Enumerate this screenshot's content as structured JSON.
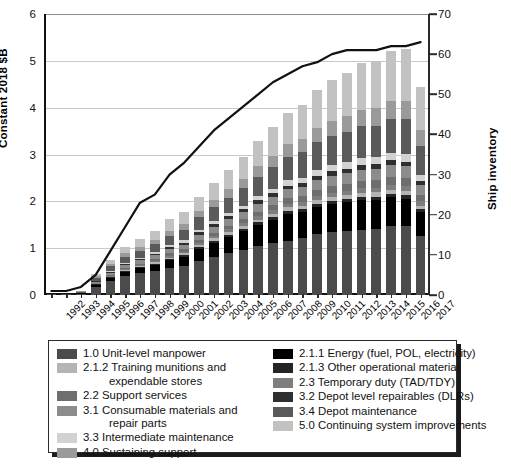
{
  "axes": {
    "left_title": "Constant 2018 $B",
    "right_title": "Ship inventory",
    "left_ticks": [
      "0",
      "1",
      "2",
      "3",
      "4",
      "5",
      "6"
    ],
    "right_ticks": [
      "0",
      "10",
      "20",
      "30",
      "40",
      "50",
      "60",
      "70"
    ]
  },
  "legend": {
    "left_column": [
      {
        "key": "manpower",
        "label": "1.0 Unit-level manpower",
        "cont": "",
        "color": "#4b4b4b"
      },
      {
        "key": "training",
        "label": "2.1.2 Training munitions and",
        "cont": "expendable stores",
        "color": "#b4b4b4"
      },
      {
        "key": "support",
        "label": "2.2 Support services",
        "cont": "",
        "color": "#6e6e6e"
      },
      {
        "key": "consumable",
        "label": "3.1 Consumable materials and",
        "cont": "repair parts",
        "color": "#8c8c8c"
      },
      {
        "key": "intermed",
        "label": "3.3 Intermediate maintenance",
        "cont": "",
        "color": "#d2d2d2"
      },
      {
        "key": "sustaining",
        "label": "4.0 Sustaining support",
        "cont": "",
        "color": "#9a9a9a"
      }
    ],
    "right_column": [
      {
        "key": "energy",
        "label": "2.1.1 Energy (fuel, POL, electricity)",
        "color": "#000000"
      },
      {
        "key": "othermat",
        "label": "2.1.3 Other operational material",
        "color": "#242424"
      },
      {
        "key": "tad",
        "label": "2.3 Temporary duty (TAD/TDY)",
        "color": "#7e7e7e"
      },
      {
        "key": "dlr",
        "label": "3.2 Depot level repairables (DLRs)",
        "color": "#2f2f2f"
      },
      {
        "key": "depotmnt",
        "label": "3.4 Depot maintenance",
        "color": "#5a5a5a"
      },
      {
        "key": "continue",
        "label": "5.0 Continuing system improvements",
        "color": "#c2c2c2"
      }
    ]
  },
  "chart_data": {
    "type": "bar",
    "title": "",
    "xlabel": "",
    "ylabel": "Constant 2018 $B",
    "y2label": "Ship inventory",
    "ylim": [
      0,
      6
    ],
    "y2lim": [
      0,
      70
    ],
    "grid": true,
    "legend_position": "bottom",
    "categories": [
      "1992",
      "1993",
      "1994",
      "1995",
      "1996",
      "1997",
      "1998",
      "1999",
      "2000",
      "2001",
      "2002",
      "2003",
      "2004",
      "2005",
      "2006",
      "2007",
      "2008",
      "2009",
      "2010",
      "2011",
      "2012",
      "2013",
      "2014",
      "2015",
      "2016",
      "2017"
    ],
    "stack_order": [
      "manpower",
      "energy",
      "othermat",
      "training",
      "tad",
      "support",
      "consumable",
      "dlr",
      "intermed",
      "depotmnt",
      "sustaining",
      "continue"
    ],
    "series": [
      {
        "name": "1.0 Unit-level manpower",
        "key": "manpower",
        "color": "#4b4b4b",
        "values": [
          0.02,
          0.02,
          0.03,
          0.18,
          0.3,
          0.4,
          0.46,
          0.52,
          0.57,
          0.61,
          0.72,
          0.82,
          0.9,
          0.97,
          1.04,
          1.1,
          1.16,
          1.22,
          1.3,
          1.34,
          1.36,
          1.39,
          1.41,
          1.47,
          1.48,
          1.27
        ]
      },
      {
        "name": "2.1.1 Energy (fuel, POL, electricity)",
        "key": "energy",
        "color": "#000000",
        "values": [
          0.0,
          0.0,
          0.01,
          0.04,
          0.07,
          0.09,
          0.11,
          0.13,
          0.17,
          0.21,
          0.26,
          0.3,
          0.34,
          0.39,
          0.46,
          0.51,
          0.58,
          0.55,
          0.57,
          0.6,
          0.62,
          0.63,
          0.62,
          0.62,
          0.58,
          0.5
        ]
      },
      {
        "name": "2.1.3 Other operational material",
        "key": "othermat",
        "color": "#242424",
        "values": [
          0.0,
          0.0,
          0.0,
          0.01,
          0.01,
          0.02,
          0.02,
          0.02,
          0.03,
          0.03,
          0.04,
          0.04,
          0.05,
          0.05,
          0.05,
          0.06,
          0.06,
          0.06,
          0.07,
          0.07,
          0.07,
          0.07,
          0.07,
          0.07,
          0.07,
          0.06
        ]
      },
      {
        "name": "2.1.2 Training munitions and expendable stores",
        "key": "training",
        "color": "#b4b4b4",
        "values": [
          0.0,
          0.0,
          0.0,
          0.01,
          0.01,
          0.02,
          0.02,
          0.03,
          0.03,
          0.04,
          0.04,
          0.05,
          0.05,
          0.06,
          0.06,
          0.07,
          0.07,
          0.07,
          0.08,
          0.08,
          0.08,
          0.09,
          0.09,
          0.09,
          0.09,
          0.08
        ]
      },
      {
        "name": "2.3 Temporary duty (TAD/TDY)",
        "key": "tad",
        "color": "#7e7e7e",
        "values": [
          0.0,
          0.0,
          0.0,
          0.01,
          0.02,
          0.02,
          0.03,
          0.03,
          0.04,
          0.04,
          0.05,
          0.05,
          0.06,
          0.06,
          0.07,
          0.07,
          0.08,
          0.08,
          0.09,
          0.09,
          0.1,
          0.1,
          0.1,
          0.11,
          0.11,
          0.09
        ]
      },
      {
        "name": "2.2 Support services",
        "key": "support",
        "color": "#6e6e6e",
        "values": [
          0.0,
          0.0,
          0.0,
          0.01,
          0.02,
          0.03,
          0.03,
          0.04,
          0.05,
          0.05,
          0.06,
          0.07,
          0.08,
          0.09,
          0.1,
          0.11,
          0.12,
          0.13,
          0.14,
          0.15,
          0.15,
          0.16,
          0.16,
          0.17,
          0.17,
          0.14
        ]
      },
      {
        "name": "3.1 Consumable materials and repair parts",
        "key": "consumable",
        "color": "#8c8c8c",
        "values": [
          0.0,
          0.0,
          0.01,
          0.03,
          0.05,
          0.06,
          0.07,
          0.08,
          0.09,
          0.1,
          0.12,
          0.13,
          0.14,
          0.15,
          0.17,
          0.18,
          0.19,
          0.2,
          0.21,
          0.22,
          0.23,
          0.24,
          0.24,
          0.25,
          0.25,
          0.21
        ]
      },
      {
        "name": "3.2 Depot level repairables (DLRs)",
        "key": "dlr",
        "color": "#2f2f2f",
        "values": [
          0.0,
          0.0,
          0.0,
          0.01,
          0.02,
          0.02,
          0.03,
          0.03,
          0.04,
          0.04,
          0.05,
          0.05,
          0.06,
          0.06,
          0.07,
          0.07,
          0.08,
          0.08,
          0.09,
          0.09,
          0.09,
          0.1,
          0.1,
          0.1,
          0.1,
          0.09
        ]
      },
      {
        "name": "3.3 Intermediate maintenance",
        "key": "intermed",
        "color": "#d2d2d2",
        "values": [
          0.0,
          0.0,
          0.0,
          0.01,
          0.02,
          0.03,
          0.03,
          0.04,
          0.05,
          0.05,
          0.06,
          0.07,
          0.07,
          0.08,
          0.09,
          0.1,
          0.11,
          0.12,
          0.13,
          0.13,
          0.14,
          0.15,
          0.15,
          0.16,
          0.16,
          0.13
        ]
      },
      {
        "name": "3.4 Depot maintenance",
        "key": "depotmnt",
        "color": "#5a5a5a",
        "values": [
          0.0,
          0.01,
          0.02,
          0.06,
          0.1,
          0.13,
          0.15,
          0.17,
          0.2,
          0.22,
          0.26,
          0.3,
          0.33,
          0.37,
          0.42,
          0.46,
          0.5,
          0.54,
          0.58,
          0.62,
          0.64,
          0.67,
          0.68,
          0.72,
          0.74,
          0.62
        ]
      },
      {
        "name": "4.0 Sustaining support",
        "key": "sustaining",
        "color": "#9a9a9a",
        "values": [
          0.0,
          0.0,
          0.01,
          0.03,
          0.05,
          0.07,
          0.08,
          0.09,
          0.11,
          0.12,
          0.14,
          0.16,
          0.18,
          0.2,
          0.23,
          0.25,
          0.27,
          0.29,
          0.31,
          0.33,
          0.34,
          0.36,
          0.37,
          0.39,
          0.4,
          0.33
        ]
      },
      {
        "name": "5.0 Continuing system improvements",
        "key": "continue",
        "color": "#c2c2c2",
        "values": [
          0.0,
          0.0,
          0.01,
          0.05,
          0.09,
          0.13,
          0.16,
          0.19,
          0.24,
          0.26,
          0.3,
          0.36,
          0.41,
          0.46,
          0.54,
          0.6,
          0.66,
          0.72,
          0.8,
          0.88,
          0.92,
          0.99,
          1.0,
          1.07,
          1.11,
          0.93
        ]
      }
    ],
    "line_series": {
      "name": "Ship inventory",
      "color": "#111111",
      "axis": "right",
      "values": [
        1,
        1,
        2,
        5,
        11,
        17,
        23,
        25,
        30,
        33,
        37,
        41,
        44,
        47,
        50,
        53,
        55,
        57,
        58,
        60,
        61,
        61,
        61,
        62,
        62,
        63
      ]
    }
  }
}
